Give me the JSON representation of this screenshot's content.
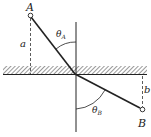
{
  "diagram": {
    "type": "refraction-path",
    "points": {
      "A": {
        "label": "A",
        "x": 30,
        "y": 15
      },
      "B": {
        "label": "B",
        "x": 142,
        "y": 110
      },
      "intersection": {
        "x": 75,
        "y": 74
      }
    },
    "distances": {
      "a": {
        "label": "a"
      },
      "b": {
        "label": "b"
      }
    },
    "angles": {
      "theta_A": {
        "symbol": "θ",
        "subscript": "A"
      },
      "theta_B": {
        "symbol": "θ",
        "subscript": "B"
      }
    },
    "colors": {
      "line": "#222222",
      "hatch": "#555555",
      "background": "#ffffff"
    }
  }
}
